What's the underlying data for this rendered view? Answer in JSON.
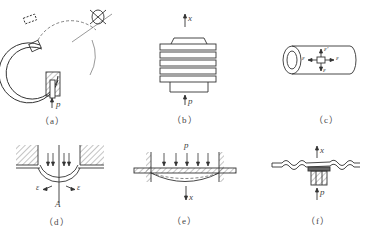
{
  "figure": {
    "panels": [
      {
        "id": "a",
        "caption": "（a）",
        "labels": {
          "pressure": "p"
        },
        "description": "Bourdon tube (C-shaped elastic tube) with pressure inlet"
      },
      {
        "id": "b",
        "caption": "（b）",
        "labels": {
          "displacement": "x",
          "pressure": "p"
        },
        "description": "Bellows"
      },
      {
        "id": "c",
        "caption": "（c）",
        "labels": {
          "strain_left": "ε",
          "strain_right": "ε",
          "strain_top": "ε'",
          "strain_bottom": "ε"
        },
        "description": "Cylindrical tube with strain element"
      },
      {
        "id": "d",
        "caption": "（d）",
        "labels": {
          "strain_left": "ε",
          "strain_right": "ε",
          "point": "A"
        },
        "description": "Clamped curved diaphragm under pressure"
      },
      {
        "id": "e",
        "caption": "（e）",
        "labels": {
          "pressure": "p",
          "displacement": "x"
        },
        "description": "Flat diaphragm clamped at edges"
      },
      {
        "id": "f",
        "caption": "（f）",
        "labels": {
          "displacement": "x",
          "pressure": "p"
        },
        "description": "Corrugated diaphragm"
      }
    ]
  },
  "colors": {
    "line": "#333333",
    "hatch": "#555555",
    "background": "#ffffff"
  }
}
